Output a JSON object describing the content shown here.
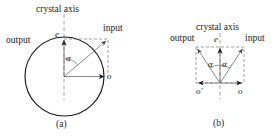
{
  "figure": {
    "type": "diagram",
    "panels": [
      {
        "id": "a",
        "caption": "(a)",
        "labels": {
          "crystal_axis": "crystal axis",
          "input": "input",
          "output": "output",
          "extraordinary": "e",
          "ordinary": "o",
          "angle": "α"
        }
      },
      {
        "id": "b",
        "caption": "(b)",
        "labels": {
          "crystal_axis": "crystal axis",
          "input": "input",
          "output": "output",
          "extraordinary": "e",
          "ordinary_right": "o",
          "ordinary_left": "o'",
          "angle_left": "α",
          "angle_right": "α"
        }
      }
    ],
    "colors": {
      "stroke_solid": "#1b1b1b",
      "stroke_thin": "#5a5a5a",
      "stroke_dash": "#7a7a7a",
      "background": "#ffffff",
      "text": "#1b1b1b"
    }
  }
}
